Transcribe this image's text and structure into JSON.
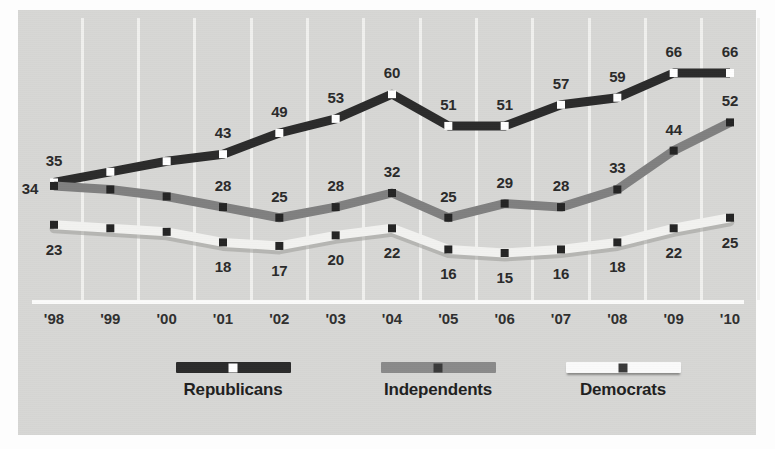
{
  "chart_data": {
    "type": "line",
    "title": "",
    "subtitle": "",
    "xlabel": "",
    "ylabel": "",
    "grid": true,
    "legend_position": "bottom",
    "ylim": [
      0,
      75
    ],
    "categories": [
      "'98",
      "'99",
      "'00",
      "'01",
      "'02",
      "'03",
      "'04",
      "'05",
      "'06",
      "'07",
      "'08",
      "'09",
      "'10"
    ],
    "series": [
      {
        "name": "Republicans",
        "color": "#2b2b2b",
        "marker": "white-square",
        "values": [
          35,
          38,
          41,
          43,
          49,
          53,
          60,
          51,
          51,
          57,
          59,
          66,
          66
        ],
        "labels": [
          "35",
          "",
          "",
          "43",
          "49",
          "53",
          "60",
          "51",
          "51",
          "57",
          "59",
          "66",
          "66"
        ],
        "label_positions": [
          "above",
          "",
          "",
          "above",
          "above",
          "above",
          "above",
          "above",
          "above",
          "above",
          "above",
          "above",
          "above"
        ]
      },
      {
        "name": "Independents",
        "color": "#808080",
        "marker": "dark-square",
        "values": [
          34,
          33,
          31,
          28,
          25,
          28,
          32,
          25,
          29,
          28,
          33,
          44,
          52
        ],
        "labels": [
          "34",
          "",
          "",
          "28",
          "25",
          "28",
          "32",
          "25",
          "29",
          "28",
          "33",
          "44",
          "52"
        ],
        "label_positions": [
          "left",
          "",
          "",
          "above",
          "above",
          "above",
          "above",
          "above",
          "above",
          "above",
          "above",
          "above",
          "above"
        ]
      },
      {
        "name": "Democrats",
        "color": "#f2f2f0",
        "marker": "dark-square",
        "values": [
          23,
          22,
          21,
          18,
          17,
          20,
          22,
          16,
          15,
          16,
          18,
          22,
          25
        ],
        "labels": [
          "23",
          "",
          "",
          "18",
          "17",
          "20",
          "22",
          "16",
          "15",
          "16",
          "18",
          "22",
          "25"
        ],
        "label_positions": [
          "below",
          "",
          "",
          "below",
          "below",
          "below",
          "below",
          "below",
          "below",
          "below",
          "below",
          "below",
          "below"
        ]
      }
    ]
  },
  "legend": {
    "items": [
      {
        "label": "Republicans",
        "swatch_color": "#2b2b2b",
        "dot_color": "#ffffff"
      },
      {
        "label": "Independents",
        "swatch_color": "#8a8a8a",
        "dot_color": "#3a3a3a"
      },
      {
        "label": "Democrats",
        "swatch_color": "#fafafa",
        "dot_color": "#3a3a3a"
      }
    ]
  },
  "colors": {
    "panel_background": "#d7d7d5",
    "page_background": "#fdfdfd",
    "gridline": "#f0f0ee",
    "axis": "#fbfbfa",
    "label_text": "#2a2a2a"
  },
  "background_bleed": {
    "line1": "",
    "line2": "",
    "line3": "",
    "line4": "",
    "line5": ""
  }
}
